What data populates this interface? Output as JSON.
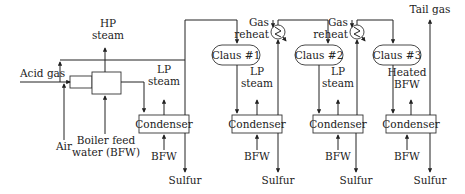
{
  "inputs": {
    "acid_gas": "Acid gas",
    "air": "Air",
    "bfw_full": [
      "Boiler feed",
      "water (BFW)"
    ]
  },
  "outputs": {
    "hp_steam": [
      "HP",
      "steam"
    ],
    "tail_gas": "Tail gas"
  },
  "condensers": [
    {
      "label": "Condenser",
      "steam": [
        "LP",
        "steam"
      ],
      "feed": "BFW",
      "product": "Sulfur"
    },
    {
      "label": "Condenser",
      "steam": [
        "LP",
        "steam"
      ],
      "feed": "BFW",
      "product": "Sulfur"
    },
    {
      "label": "Condenser",
      "steam": [
        "LP",
        "steam"
      ],
      "feed": "BFW",
      "product": "Sulfur"
    },
    {
      "label": "Condenser",
      "steam": [
        "Heated",
        "BFW"
      ],
      "feed": "BFW",
      "product": "Sulfur"
    }
  ],
  "reactors": [
    {
      "label": "Claus #1"
    },
    {
      "label": "Claus #2"
    },
    {
      "label": "Claus #3"
    }
  ],
  "reheaters": [
    {
      "label": [
        "Gas",
        "reheat"
      ]
    },
    {
      "label": [
        "Gas",
        "reheat"
      ]
    }
  ]
}
